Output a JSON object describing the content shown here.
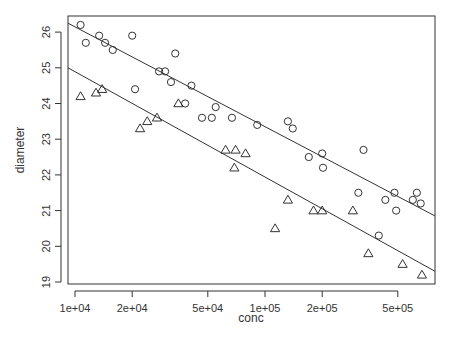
{
  "chart_data": {
    "type": "scatter",
    "title": "",
    "xlabel": "conc",
    "ylabel": "diameter",
    "xscale": "log",
    "xlim": [
      9200,
      750000
    ],
    "ylim": [
      18.95,
      26.45
    ],
    "grid": false,
    "legend": null,
    "x_ticks": [
      {
        "value": 10000,
        "label": "1e+04"
      },
      {
        "value": 20000,
        "label": "2e+04"
      },
      {
        "value": 50000,
        "label": "5e+04"
      },
      {
        "value": 100000,
        "label": "1e+05"
      },
      {
        "value": 200000,
        "label": "2e+05"
      },
      {
        "value": 500000,
        "label": "5e+05"
      }
    ],
    "y_ticks": [
      {
        "value": 19,
        "label": "19"
      },
      {
        "value": 20,
        "label": "20"
      },
      {
        "value": 21,
        "label": "21"
      },
      {
        "value": 22,
        "label": "22"
      },
      {
        "value": 23,
        "label": "23"
      },
      {
        "value": 24,
        "label": "24"
      },
      {
        "value": 25,
        "label": "25"
      },
      {
        "value": 26,
        "label": "26"
      }
    ],
    "series": [
      {
        "name": "circles",
        "marker": "circle",
        "points": [
          [
            10700,
            26.2
          ],
          [
            11400,
            25.7
          ],
          [
            13400,
            25.9
          ],
          [
            14400,
            25.7
          ],
          [
            15800,
            25.5
          ],
          [
            20000,
            25.9
          ],
          [
            20700,
            24.4
          ],
          [
            27700,
            24.9
          ],
          [
            29800,
            24.9
          ],
          [
            32000,
            24.6
          ],
          [
            33700,
            25.4
          ],
          [
            38000,
            24.0
          ],
          [
            41000,
            24.5
          ],
          [
            46600,
            23.6
          ],
          [
            52500,
            23.6
          ],
          [
            55000,
            23.9
          ],
          [
            67000,
            23.6
          ],
          [
            91000,
            23.4
          ],
          [
            132000,
            23.5
          ],
          [
            140000,
            23.3
          ],
          [
            170000,
            22.5
          ],
          [
            200000,
            22.6
          ],
          [
            202000,
            22.2
          ],
          [
            310000,
            21.5
          ],
          [
            330000,
            22.7
          ],
          [
            397000,
            20.3
          ],
          [
            430000,
            21.3
          ],
          [
            480000,
            21.5
          ],
          [
            490000,
            21.0
          ],
          [
            600000,
            21.3
          ],
          [
            630000,
            21.5
          ],
          [
            660000,
            21.2
          ]
        ]
      },
      {
        "name": "triangles",
        "marker": "triangle",
        "points": [
          [
            10700,
            24.2
          ],
          [
            12900,
            24.3
          ],
          [
            13900,
            24.4
          ],
          [
            22000,
            23.3
          ],
          [
            24000,
            23.5
          ],
          [
            27000,
            23.6
          ],
          [
            35000,
            24.0
          ],
          [
            62000,
            22.7
          ],
          [
            70000,
            22.7
          ],
          [
            79000,
            22.6
          ],
          [
            69000,
            22.2
          ],
          [
            113000,
            20.5
          ],
          [
            132000,
            21.3
          ],
          [
            180000,
            21.0
          ],
          [
            200000,
            21.0
          ],
          [
            290000,
            21.0
          ],
          [
            350000,
            19.8
          ],
          [
            530000,
            19.5
          ],
          [
            670000,
            19.2
          ]
        ]
      }
    ],
    "lines": [
      {
        "name": "fit-circles",
        "from": [
          9200,
          26.25
        ],
        "to": [
          750000,
          20.85
        ]
      },
      {
        "name": "fit-triangles",
        "from": [
          9200,
          25.0
        ],
        "to": [
          750000,
          19.3
        ]
      }
    ]
  }
}
